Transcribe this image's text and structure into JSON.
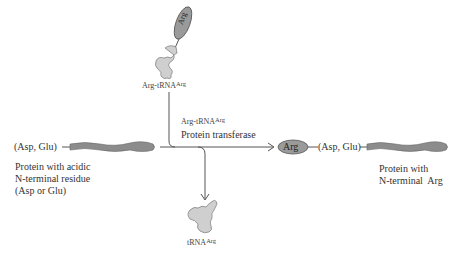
{
  "diagram": {
    "colors": {
      "protein_fill": "#8c8c8c",
      "trna_fill": "#cfcfcf",
      "arg_oval_fill": "#9a9a9a",
      "line": "#555555",
      "text": "#333333"
    },
    "top_trna": {
      "arg_oval_label": "Arg",
      "label": "Arg-tRNA",
      "label_sup": "Arg"
    },
    "reaction": {
      "enzyme_line1": "Arg-tRNA",
      "enzyme_line1_sup": "Arg",
      "enzyme_line2": "Protein transferase"
    },
    "left_protein": {
      "residue_label": "(Asp, Glu)",
      "caption_lines": [
        "Protein with acidic",
        "N-terminal residue",
        "(Asp or Glu)"
      ]
    },
    "right_protein": {
      "arg_oval_label": "Arg",
      "residue_label": "(Asp, Glu)",
      "caption_lines": [
        "Protein with",
        "N-terminal  Arg"
      ]
    },
    "bottom_trna": {
      "label": "tRNA",
      "label_sup": "Arg"
    }
  }
}
